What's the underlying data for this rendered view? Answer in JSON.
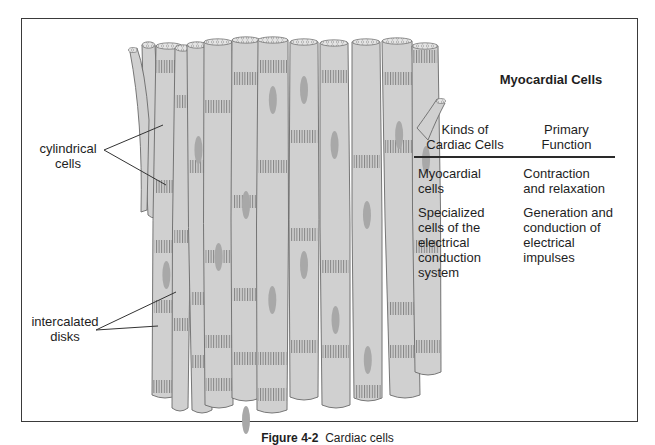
{
  "figure": {
    "caption_label": "Figure 4-2",
    "caption_text": "Cardiac cells"
  },
  "diagram": {
    "labels": {
      "cylindrical": [
        "cylindrical",
        "cells"
      ],
      "intercalated": [
        "intercalated",
        "disks"
      ]
    },
    "colors": {
      "cell_fill": "#d0d0d0",
      "cell_outline": "#6a6a6a",
      "nucleus": "#a8a8a8",
      "disk_stripe": "#7a7a7a"
    }
  },
  "table": {
    "title": "Myocardial Cells",
    "headers": [
      [
        "Kinds of",
        "Cardiac Cells"
      ],
      [
        "Primary",
        "Function"
      ]
    ],
    "rows": [
      {
        "kind": [
          "Myocardial",
          "cells"
        ],
        "function": [
          "Contraction",
          "and relaxation"
        ]
      },
      {
        "kind": [
          "Specialized",
          "cells of the",
          "electrical",
          "conduction",
          "system"
        ],
        "function": [
          "Generation and",
          "conduction of",
          "electrical",
          "impulses"
        ]
      }
    ]
  }
}
